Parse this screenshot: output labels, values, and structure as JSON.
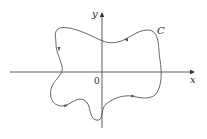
{
  "diagram": {
    "type": "closed-curve-on-axes",
    "axes": {
      "x_label": "x",
      "y_label": "y",
      "origin_label": "0"
    },
    "curve": {
      "label": "C",
      "orientation": "counterclockwise",
      "color": "#555555"
    },
    "colors": {
      "axis": "#333333",
      "curve": "#555555",
      "text": "#2a2a2a",
      "background": "#ffffff"
    }
  }
}
